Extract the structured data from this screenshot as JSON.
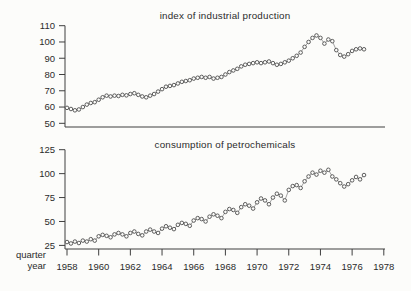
{
  "figure": {
    "background": "#fcfcfa",
    "xaxis_corner_label_line1": "quarter",
    "xaxis_corner_label_line2": "year",
    "colors": {
      "axis": "#3f3f3f",
      "series_line": "#8a8a8a",
      "marker_stroke": "#4d4d4d",
      "marker_fill": "#fcfcfa",
      "text": "#2b2b2b"
    }
  },
  "chart_data": [
    {
      "type": "line",
      "title": "index of industrial production",
      "marker": "open-circle",
      "x_unit": "quarter",
      "x_start": "1958 Q1",
      "x_end": "1976 Q4",
      "ylim": [
        50,
        110
      ],
      "yticks": [
        110,
        100,
        90,
        80,
        70,
        60,
        50
      ],
      "grid": false,
      "values": [
        59.5,
        58.8,
        58,
        58.5,
        60,
        61.5,
        62.5,
        63,
        64.5,
        66,
        67,
        66.5,
        67,
        66.8,
        67.5,
        67.2,
        68,
        68.5,
        67.5,
        66.5,
        66,
        67,
        68,
        69.5,
        71,
        72.5,
        73,
        73.5,
        74.5,
        75.5,
        76,
        76.5,
        77.5,
        78,
        78.5,
        78,
        78.5,
        77.5,
        78,
        78.5,
        80,
        81.5,
        82.5,
        83.5,
        85,
        86,
        86.5,
        87,
        87.5,
        87,
        87.5,
        88,
        87,
        86,
        86.5,
        87.5,
        88.5,
        90,
        91.5,
        93.5,
        97,
        100,
        102.5,
        104,
        102.5,
        99,
        101.5,
        100.5,
        95,
        92,
        91,
        92.5,
        94.5,
        95.5,
        96,
        95.5
      ]
    },
    {
      "type": "line",
      "title": "consumption of petrochemicals",
      "marker": "open-circle",
      "x_unit": "quarter",
      "x_start": "1958 Q1",
      "x_end": "1976 Q4",
      "ylim": [
        25,
        125
      ],
      "yticks": [
        125,
        100,
        75,
        50,
        25
      ],
      "xticks": [
        1958,
        1960,
        1962,
        1964,
        1966,
        1968,
        1970,
        1972,
        1974,
        1976,
        1978
      ],
      "grid": false,
      "values": [
        28.5,
        27,
        29,
        27.5,
        30,
        29,
        31.5,
        30,
        34.5,
        36,
        35,
        33.5,
        36.5,
        38,
        36.5,
        34.5,
        38,
        39.5,
        37,
        35.5,
        39.5,
        41.5,
        39.5,
        38,
        42.5,
        45,
        43.5,
        42,
        46.5,
        48.5,
        47.5,
        45.5,
        51,
        53.5,
        52.5,
        50,
        55,
        57.5,
        56,
        53.5,
        60,
        63,
        62,
        59,
        65,
        68,
        66.5,
        63.5,
        70,
        74,
        72,
        68,
        75,
        79,
        77,
        72,
        83,
        87,
        88,
        85,
        92,
        97,
        101,
        99,
        103,
        101,
        104,
        97,
        94,
        90,
        86.5,
        89,
        93,
        96.5,
        94,
        98.5
      ]
    }
  ]
}
